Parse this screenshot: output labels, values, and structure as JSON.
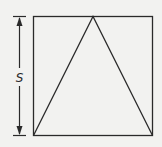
{
  "figure": {
    "dimension_label": "S",
    "colors": {
      "stroke": "#2a2a2a",
      "background": "#f2f2f0"
    }
  }
}
